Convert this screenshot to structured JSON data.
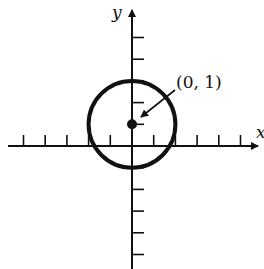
{
  "chart_data": {
    "type": "scatter",
    "title": "",
    "xlabel": "x",
    "ylabel": "y",
    "xlim": [
      -6,
      6
    ],
    "ylim": [
      -5,
      5
    ],
    "grid": false,
    "tick_spacing": 1,
    "x_ticks": [
      -5,
      -4,
      -3,
      -2,
      -1,
      1,
      2,
      3,
      4,
      5
    ],
    "y_ticks": [
      -5,
      -4,
      -3,
      -2,
      -1,
      1,
      2,
      3,
      4,
      5
    ],
    "shapes": [
      {
        "kind": "circle",
        "center": [
          0,
          1
        ],
        "radius": 2
      }
    ],
    "points": [
      {
        "x": 0,
        "y": 1,
        "label": "(0, 1)",
        "annotated_with_arrow": true
      }
    ]
  },
  "labels": {
    "x_axis": "x",
    "y_axis": "y",
    "center_point": "(0, 1)"
  },
  "colors": {
    "ink": "#111111",
    "background": "#ffffff"
  }
}
